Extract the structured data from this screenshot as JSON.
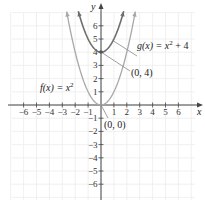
{
  "chart_data": {
    "type": "line",
    "title": "",
    "xlabel": "x",
    "ylabel": "y",
    "xlim": [
      -7,
      7.5
    ],
    "ylim": [
      -7.5,
      7.7
    ],
    "grid": true,
    "x_ticks": [
      -6,
      -5,
      -4,
      -3,
      -2,
      -1,
      1,
      2,
      3,
      4,
      5,
      6
    ],
    "y_ticks": [
      -6,
      -5,
      -4,
      -3,
      -2,
      -1,
      1,
      2,
      3,
      4,
      5,
      6
    ],
    "series": [
      {
        "name": "f(x) = x^2",
        "label": "f(x) = x",
        "label_sup": "2",
        "formula": "x^2",
        "color": "#a8a8a8",
        "x": [
          -2.66,
          -2,
          -1,
          0,
          1,
          2,
          2.66
        ],
        "y": [
          7.08,
          4,
          1,
          0,
          1,
          4,
          7.08
        ]
      },
      {
        "name": "g(x) = x^2 + 4",
        "label": "g(x) = x",
        "label_sup": "2",
        "label_tail": " + 4",
        "formula": "x^2 + 4",
        "color": "#6e6e6e",
        "x": [
          -1.76,
          -1,
          0,
          1,
          1.76
        ],
        "y": [
          7.1,
          5,
          4,
          5,
          7.1
        ]
      }
    ],
    "annotations": [
      {
        "text": "(0, 4)",
        "point": [
          0,
          4
        ]
      },
      {
        "text": "(0, 0)",
        "point": [
          0,
          0
        ]
      }
    ]
  },
  "labels": {
    "x_axis": "x",
    "y_axis": "y",
    "f_label": "f(x) = x",
    "f_sup": "2",
    "g_label": "g(x) = x",
    "g_sup": "2",
    "g_tail": " + 4",
    "point_04": "(0, 4)",
    "point_00": "(0, 0)"
  }
}
